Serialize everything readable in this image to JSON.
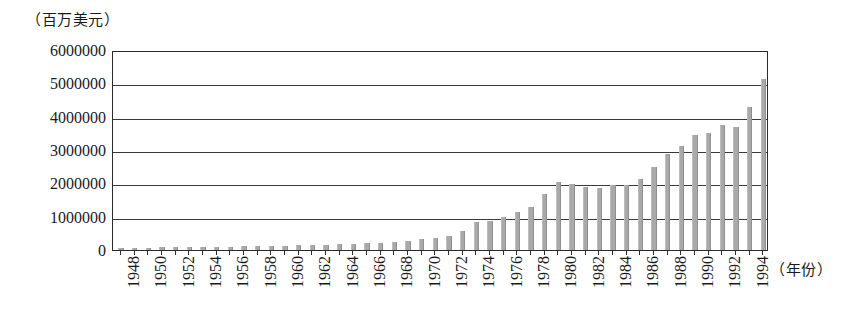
{
  "chart_data": {
    "type": "bar",
    "title": "",
    "subtitle": "",
    "xlabel": "（年份）",
    "ylabel": "（百万美元）",
    "ylim": [
      0,
      6000000
    ],
    "ytick_step": 1000000,
    "ytick_labels": [
      "6000000",
      "5000000",
      "4000000",
      "3000000",
      "2000000",
      "1000000",
      "0"
    ],
    "ytick_values": [
      6000000,
      5000000,
      4000000,
      3000000,
      2000000,
      1000000,
      0
    ],
    "grid": true,
    "legend": null,
    "bar_color": "#a9a9a9",
    "axis_color": "#2b2b2b",
    "xtick_labels": [
      "1948",
      "1950",
      "1952",
      "1954",
      "1956",
      "1958",
      "1960",
      "1962",
      "1964",
      "1966",
      "1968",
      "1970",
      "1972",
      "1974",
      "1976",
      "1978",
      "1980",
      "1982",
      "1984",
      "1986",
      "1988",
      "1990",
      "1992",
      "1994"
    ],
    "xtick_years": [
      1948,
      1950,
      1952,
      1954,
      1956,
      1958,
      1960,
      1962,
      1964,
      1966,
      1968,
      1970,
      1972,
      1974,
      1976,
      1978,
      1980,
      1982,
      1984,
      1986,
      1988,
      1990,
      1992,
      1994
    ],
    "categories": [
      1948,
      1949,
      1950,
      1951,
      1952,
      1953,
      1954,
      1955,
      1956,
      1957,
      1958,
      1959,
      1960,
      1961,
      1962,
      1963,
      1964,
      1965,
      1966,
      1967,
      1968,
      1969,
      1970,
      1971,
      1972,
      1973,
      1974,
      1975,
      1976,
      1977,
      1978,
      1979,
      1980,
      1981,
      1982,
      1983,
      1984,
      1985,
      1986,
      1987,
      1988,
      1989,
      1990,
      1991,
      1992,
      1993,
      1994,
      1995
    ],
    "values": [
      58000,
      58000,
      61000,
      83000,
      82000,
      84000,
      90000,
      95000,
      105000,
      112000,
      108000,
      116000,
      130000,
      137000,
      145000,
      157000,
      177000,
      189000,
      206000,
      216000,
      240000,
      273000,
      317000,
      353000,
      417000,
      579000,
      843000,
      877000,
      991000,
      1127000,
      1304000,
      1670000,
      2035000,
      1990000,
      1880000,
      1850000,
      1950000,
      1950000,
      2130000,
      2500000,
      2880000,
      3110000,
      3450000,
      3510000,
      3760000,
      3690000,
      4280000,
      5120000
    ]
  }
}
